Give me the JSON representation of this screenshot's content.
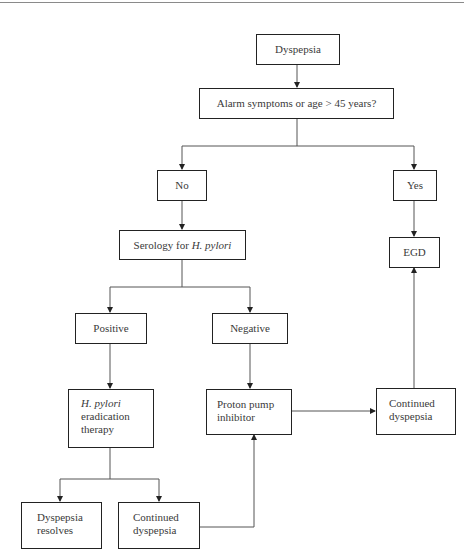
{
  "diagram": {
    "type": "flowchart",
    "nodes": {
      "dyspepsia": {
        "label": "Dyspepsia"
      },
      "alarm": {
        "label": "Alarm symptoms or age > 45 years?"
      },
      "no": {
        "label": "No"
      },
      "yes": {
        "label": "Yes"
      },
      "serology": {
        "label_prefix": "Serology for ",
        "label_italic": "H. pylori"
      },
      "egd": {
        "label": "EGD"
      },
      "positive": {
        "label": "Positive"
      },
      "negative": {
        "label": "Negative"
      },
      "eradication": {
        "label_italic": "H. pylori",
        "line2": "eradication",
        "line3": "therapy"
      },
      "ppi": {
        "line1": "Proton pump",
        "line2": "inhibitor"
      },
      "continued_right": {
        "line1": "Continued",
        "line2": "dyspepsia"
      },
      "resolves": {
        "line1": "Dyspepsia",
        "line2": "resolves"
      },
      "continued_bottom": {
        "line1": "Continued",
        "line2": "dyspepsia"
      }
    },
    "edges": [
      [
        "dyspepsia",
        "alarm"
      ],
      [
        "alarm",
        "no"
      ],
      [
        "alarm",
        "yes"
      ],
      [
        "no",
        "serology"
      ],
      [
        "yes",
        "egd"
      ],
      [
        "serology",
        "positive"
      ],
      [
        "serology",
        "negative"
      ],
      [
        "positive",
        "eradication"
      ],
      [
        "negative",
        "ppi"
      ],
      [
        "eradication",
        "resolves"
      ],
      [
        "eradication",
        "continued_bottom"
      ],
      [
        "continued_bottom",
        "ppi"
      ],
      [
        "ppi",
        "continued_right"
      ],
      [
        "continued_right",
        "egd"
      ]
    ]
  }
}
